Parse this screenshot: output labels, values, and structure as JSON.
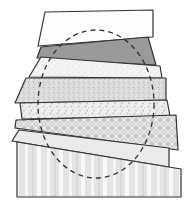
{
  "figure": {
    "width": 191,
    "height": 210,
    "background": "#ffffff",
    "stroke": "#333333",
    "strips": [
      {
        "name": "strip-1-plain-white",
        "points": "45,12 153,10 153,37 38,46",
        "fill": "#fdfdfd",
        "pattern": "none"
      },
      {
        "name": "strip-2-dark-gray",
        "points": "41,47 148,37 156,65 37,58",
        "fill": "#9a9a9a",
        "pattern": "none"
      },
      {
        "name": "strip-3-light-speckle",
        "points": "41,57 160,66 162,78 29,77",
        "fill": "#f2f2f2",
        "pattern": "speckle-light"
      },
      {
        "name": "strip-4-gray-speckle",
        "points": "26,78 166,78 166,100 15,103",
        "fill": "#d8d8d8",
        "pattern": "speckle-dense"
      },
      {
        "name": "strip-5-white-speckle",
        "points": "20,103 167,100 170,116 22,119",
        "fill": "#ececec",
        "pattern": "speckle-coarse"
      },
      {
        "name": "strip-6-lattice",
        "points": "16,120 176,115 178,150 15,128",
        "fill": "#cfcfcf",
        "pattern": "lattice"
      },
      {
        "name": "strip-7-fine-speckle",
        "points": "19,130 169,148 169,167 12,141",
        "fill": "#ebebeb",
        "pattern": "speckle-fine"
      },
      {
        "name": "base-vertical-stripes",
        "points": "17,142 181,169 181,197 17,197",
        "fill": "#e6e6e6",
        "pattern": "vertical-stripes"
      }
    ],
    "ellipse": {
      "cx": 96,
      "cy": 104,
      "rx": 58,
      "ry": 74,
      "dash": "5,4",
      "stroke": "#333333"
    }
  }
}
